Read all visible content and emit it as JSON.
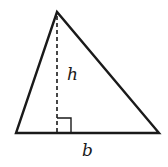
{
  "diagram": {
    "type": "triangle-area",
    "colors": {
      "stroke": "#1a1a1a",
      "background": "#ffffff"
    },
    "vertices": {
      "apex": [
        57,
        12
      ],
      "bottom_left": [
        16,
        133
      ],
      "bottom_right": [
        159,
        133
      ]
    },
    "height_line": {
      "from": [
        57,
        14
      ],
      "to": [
        57,
        133
      ],
      "style": "dashed"
    },
    "right_angle_marker": {
      "x": 57,
      "y": 118,
      "size": 14
    },
    "labels": {
      "height": "h",
      "base": "b"
    }
  }
}
